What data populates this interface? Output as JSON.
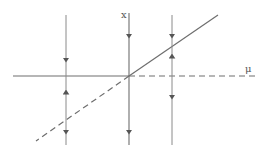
{
  "diagram": {
    "type": "transcritical-bifurcation",
    "labels": {
      "x_axis": "x",
      "mu_axis": "μ"
    },
    "colors": {
      "line": "#6e6e6e",
      "arrow": "#555555",
      "background": "#ffffff"
    },
    "branches": [
      {
        "name": "x=0 branch (mu<0)",
        "style": "solid",
        "stability": "stable"
      },
      {
        "name": "x=0 branch (mu>0)",
        "style": "dashed",
        "stability": "unstable"
      },
      {
        "name": "x=mu branch (mu>0)",
        "style": "solid",
        "stability": "stable"
      },
      {
        "name": "x=mu branch (mu<0)",
        "style": "dashed",
        "stability": "unstable"
      }
    ],
    "flow_lines": [
      {
        "position": "mu<0",
        "arrows": [
          "down",
          "up",
          "down"
        ]
      },
      {
        "position": "mu=0",
        "arrows": [
          "down",
          "down"
        ]
      },
      {
        "position": "mu>0",
        "arrows": [
          "down",
          "up",
          "down"
        ]
      }
    ]
  }
}
